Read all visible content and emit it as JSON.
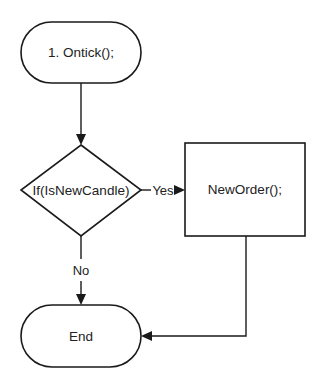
{
  "diagram": {
    "type": "flowchart",
    "nodes": {
      "start": {
        "label": "1. Ontick();",
        "shape": "terminator"
      },
      "decision": {
        "label": "If(IsNewCandle)",
        "shape": "diamond"
      },
      "action": {
        "label": "NewOrder();",
        "shape": "process"
      },
      "end": {
        "label": "End",
        "shape": "terminator"
      }
    },
    "edges": {
      "start_to_decision": {
        "from": "start",
        "to": "decision",
        "label": ""
      },
      "yes": {
        "from": "decision",
        "to": "action",
        "label": "Yes"
      },
      "no": {
        "from": "decision",
        "to": "end",
        "label": "No"
      },
      "action_to_end": {
        "from": "action",
        "to": "end",
        "label": ""
      }
    },
    "colors": {
      "stroke": "#1a1a1a",
      "fill": "#ffffff",
      "text": "#222222"
    }
  }
}
